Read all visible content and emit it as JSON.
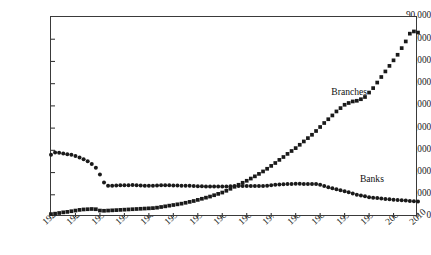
{
  "chart_data": {
    "type": "scatter",
    "title": "",
    "xlabel": "",
    "ylabel": "",
    "xlim": [
      1920,
      2010
    ],
    "ylim": [
      0,
      90000
    ],
    "grid": false,
    "legend_position": "inline-annotation",
    "ytick_labels": [
      "90,000",
      "80,000",
      "70,000",
      "60,000",
      "50,000",
      "40,000",
      "30,000",
      "20,000",
      "10,000",
      "0"
    ],
    "ytick_values": [
      90000,
      80000,
      70000,
      60000,
      50000,
      40000,
      30000,
      20000,
      10000,
      0
    ],
    "xtick_labels": [
      "1920",
      "1926",
      "1932",
      "1938",
      "1944",
      "1950",
      "1956",
      "1962",
      "1968",
      "1974",
      "1980",
      "1986",
      "1992",
      "1998",
      "2004",
      "2010"
    ],
    "xtick_values": [
      1920,
      1926,
      1932,
      1938,
      1944,
      1950,
      1956,
      1962,
      1968,
      1974,
      1980,
      1986,
      1992,
      1998,
      2004,
      2010
    ],
    "x": [
      1920,
      1921,
      1922,
      1923,
      1924,
      1925,
      1926,
      1927,
      1928,
      1929,
      1930,
      1931,
      1932,
      1933,
      1934,
      1935,
      1936,
      1937,
      1938,
      1939,
      1940,
      1941,
      1942,
      1943,
      1944,
      1945,
      1946,
      1947,
      1948,
      1949,
      1950,
      1951,
      1952,
      1953,
      1954,
      1955,
      1956,
      1957,
      1958,
      1959,
      1960,
      1961,
      1962,
      1963,
      1964,
      1965,
      1966,
      1967,
      1968,
      1969,
      1970,
      1971,
      1972,
      1973,
      1974,
      1975,
      1976,
      1977,
      1978,
      1979,
      1980,
      1981,
      1982,
      1983,
      1984,
      1985,
      1986,
      1987,
      1988,
      1989,
      1990,
      1991,
      1992,
      1993,
      1994,
      1995,
      1996,
      1997,
      1998,
      1999,
      2000,
      2001,
      2002,
      2003,
      2004,
      2005,
      2006,
      2007,
      2008,
      2009,
      2010
    ],
    "series": [
      {
        "name": "Banks",
        "marker": "circle",
        "color": "#1a1a1a",
        "label_text": "Banks",
        "values": [
          28000,
          29000,
          28900,
          28600,
          28200,
          28000,
          27500,
          26800,
          26000,
          25100,
          23900,
          22200,
          19100,
          15500,
          14100,
          14100,
          14200,
          14300,
          14300,
          14300,
          14400,
          14300,
          14200,
          14100,
          14100,
          14100,
          14200,
          14300,
          14300,
          14300,
          14200,
          14200,
          14100,
          14100,
          14100,
          13900,
          13800,
          13800,
          13700,
          13700,
          13700,
          13700,
          13700,
          13700,
          13800,
          13900,
          13900,
          13900,
          13900,
          13900,
          13900,
          13900,
          14000,
          14100,
          14300,
          14500,
          14600,
          14700,
          14800,
          14900,
          15000,
          15000,
          14900,
          14900,
          14900,
          14800,
          14500,
          14000,
          13400,
          12900,
          12500,
          12000,
          11600,
          11100,
          10600,
          10000,
          9700,
          9300,
          8900,
          8700,
          8500,
          8300,
          8100,
          8000,
          7800,
          7700,
          7500,
          7400,
          7200,
          7100,
          7000
        ]
      },
      {
        "name": "Branches",
        "marker": "square",
        "color": "#1a1a1a",
        "label_text": "Branches",
        "values": [
          1300,
          1500,
          1800,
          2100,
          2300,
          2600,
          2900,
          3200,
          3400,
          3500,
          3600,
          3500,
          2900,
          2800,
          2900,
          3000,
          3100,
          3200,
          3300,
          3400,
          3500,
          3600,
          3700,
          3800,
          3900,
          4000,
          4200,
          4500,
          4800,
          5100,
          5400,
          5700,
          6000,
          6400,
          6800,
          7200,
          7700,
          8200,
          8700,
          9200,
          9800,
          10400,
          11000,
          11800,
          12700,
          13600,
          14500,
          15400,
          16300,
          17300,
          18300,
          19400,
          20500,
          21700,
          23000,
          24300,
          25700,
          27000,
          28400,
          29700,
          31000,
          32500,
          34000,
          35500,
          37000,
          38700,
          40500,
          42300,
          44000,
          45700,
          47500,
          49000,
          50500,
          51300,
          52000,
          52300,
          53000,
          54000,
          56000,
          58000,
          60500,
          63000,
          65500,
          68000,
          70500,
          73000,
          76000,
          79000,
          82500,
          83500,
          83000
        ]
      }
    ],
    "annotations": [
      {
        "text": "Branches",
        "x": 1989,
        "y": 56000
      },
      {
        "text": "Banks",
        "x": 1996,
        "y": 16500
      }
    ]
  }
}
